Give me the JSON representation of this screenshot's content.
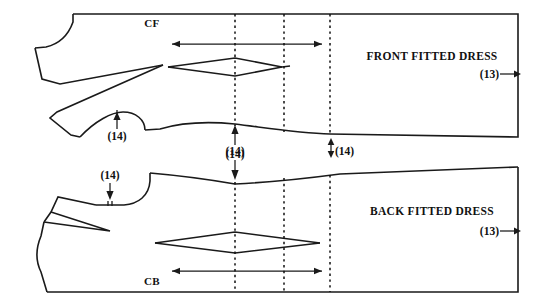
{
  "diagram": {
    "type": "sewing-pattern-technical-drawing",
    "canvas": {
      "width": 547,
      "height": 308
    },
    "colors": {
      "background": "#ffffff",
      "line": "#1a1a1a",
      "text": "#111111"
    },
    "pieces": [
      {
        "id": "front",
        "label": "FRONT FITTED DRESS",
        "label_x": 432,
        "label_y": 60,
        "fold_label": "CF",
        "fold_label_x": 152,
        "fold_label_y": 27,
        "reference_label": "(13)",
        "reference_x": 492,
        "reference_y": 78
      },
      {
        "id": "back",
        "label": "BACK FITTED DRESS",
        "label_x": 432,
        "label_y": 215,
        "fold_label": "CB",
        "fold_label_x": 152,
        "fold_label_y": 285,
        "reference_label": "(13)",
        "reference_x": 492,
        "reference_y": 235
      }
    ],
    "grade_lines": [
      {
        "id": "grade-line-1",
        "x": 235
      },
      {
        "id": "grade-line-2",
        "x": 284
      },
      {
        "id": "grade-line-3",
        "x": 330
      }
    ],
    "callouts": [
      {
        "id": "front-armhole-notch",
        "label": "(14)",
        "x": 117,
        "y": 138,
        "direction": "up"
      },
      {
        "id": "front-hem-notch",
        "label": "(14)",
        "x": 235,
        "y": 157,
        "direction": "up"
      },
      {
        "id": "front-hem-drop",
        "label": "(14)",
        "x": 347,
        "y": 155,
        "direction": "up-down"
      },
      {
        "id": "back-neck-notch",
        "label": "(14)",
        "x": 110,
        "y": 177,
        "direction": "down"
      },
      {
        "id": "back-shoulder-notch",
        "label": "(14)",
        "x": 235,
        "y": 154,
        "direction": "down"
      }
    ],
    "measure_arrows": [
      {
        "id": "front-width-arrow",
        "x1": 172,
        "x2": 322,
        "y": 44,
        "heads": "both"
      },
      {
        "id": "back-width-arrow",
        "x1": 172,
        "x2": 322,
        "y": 271,
        "heads": "both"
      }
    ],
    "darts": [
      {
        "id": "front-waist-dart",
        "left_x": 172,
        "right_x": 282,
        "center_x": 235,
        "y": 66,
        "half_height": 8
      },
      {
        "id": "back-waist-dart",
        "left_x": 155,
        "right_x": 320,
        "center_x": 235,
        "y": 242,
        "half_height": 10
      }
    ]
  }
}
